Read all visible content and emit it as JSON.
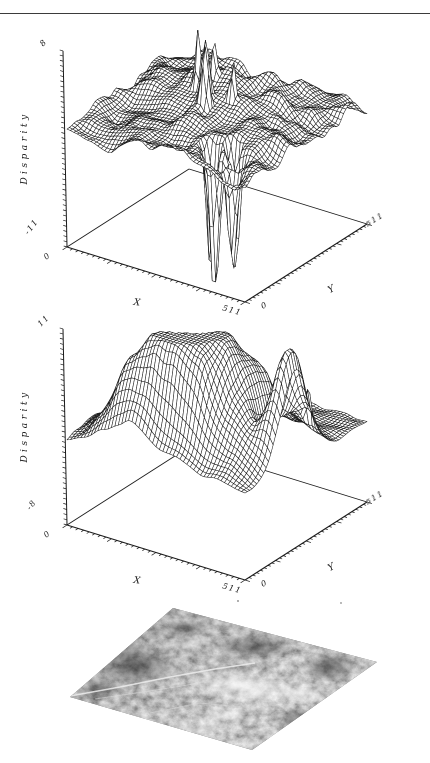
{
  "page": {
    "background": "#ffffff",
    "top_rule_color": "#3b3b3b",
    "line_color": "#1b1b1b"
  },
  "chart_data": [
    {
      "type": "3d-wireframe-surface",
      "title": "",
      "z_axis": {
        "label": "Disparity",
        "min": -11,
        "max": 8,
        "min_label": "-11",
        "max_label": "8",
        "tick_step": 0.5
      },
      "x_axis": {
        "label": "X",
        "min": 0,
        "max": 511,
        "min_label": "0",
        "max_label": "511",
        "tick_intervals": 32,
        "major_every": 8
      },
      "y_axis": {
        "label": "Y",
        "min": 0,
        "max": 511,
        "min_label": "0",
        "max_label": "511",
        "tick_intervals": 32,
        "major_every": 8
      },
      "grid": "wireframe-hidden-line",
      "projection": {
        "L": [
          67,
          217
        ],
        "F": [
          245,
          272
        ],
        "R": [
          367,
          194
        ],
        "z_px_per_unit": 10.32,
        "mesh_n": 52
      },
      "style": {
        "line_color": "#1b1b1b",
        "fill": "#ffffff"
      },
      "surface": {
        "seed": 11,
        "noise": {
          "base_amp": 1.35,
          "coupled_gain": 0,
          "cap": 1.35,
          "scale": 8
        },
        "features": [
          {
            "x": 256,
            "y": 256,
            "sx": 190,
            "sy": 190,
            "amp": 2.2
          },
          {
            "x": 140,
            "y": 340,
            "sx": 85,
            "sy": 75,
            "amp": 1.2
          },
          {
            "x": 330,
            "y": 330,
            "sx": 85,
            "sy": 85,
            "amp": 0.9
          },
          {
            "x": 80,
            "y": 80,
            "sx": 70,
            "sy": 70,
            "amp": -0.6
          },
          {
            "x": 236,
            "y": 236,
            "sx": 8,
            "sy": 8,
            "amp": 8
          },
          {
            "x": 255,
            "y": 206,
            "sx": 7,
            "sy": 7,
            "amp": 9.5
          },
          {
            "x": 188,
            "y": 276,
            "sx": 7,
            "sy": 7,
            "amp": 6
          },
          {
            "x": 302,
            "y": 252,
            "sx": 6,
            "sy": 6,
            "amp": 4.5
          },
          {
            "x": 216,
            "y": 300,
            "sx": 6,
            "sy": 6,
            "amp": 4
          },
          {
            "x": 388,
            "y": 52,
            "sx": 11,
            "sy": 11,
            "amp": -14
          },
          {
            "x": 424,
            "y": 84,
            "sx": 10,
            "sy": 10,
            "amp": -12
          },
          {
            "x": 356,
            "y": 84,
            "sx": 10,
            "sy": 10,
            "amp": -13
          },
          {
            "x": 450,
            "y": 36,
            "sx": 9,
            "sy": 9,
            "amp": -10
          },
          {
            "x": 398,
            "y": 116,
            "sx": 9,
            "sy": 9,
            "amp": -8.5
          }
        ]
      }
    },
    {
      "type": "3d-wireframe-surface",
      "title": "",
      "z_axis": {
        "label": "Disparity",
        "min": -8,
        "max": 11,
        "min_label": "-8",
        "max_label": "11",
        "tick_step": 0.5
      },
      "x_axis": {
        "label": "X",
        "min": 0,
        "max": 511,
        "min_label": "0",
        "max_label": "511",
        "tick_intervals": 32,
        "major_every": 8
      },
      "y_axis": {
        "label": "Y",
        "min": 0,
        "max": 511,
        "min_label": "0",
        "max_label": "511",
        "tick_intervals": 32,
        "major_every": 8
      },
      "grid": "wireframe-hidden-line",
      "projection": {
        "L": [
          67,
          217
        ],
        "F": [
          245,
          272
        ],
        "R": [
          367,
          194
        ],
        "z_px_per_unit": 10.32,
        "mesh_n": 52
      },
      "style": {
        "line_color": "#1b1b1b",
        "fill": "#ffffff"
      },
      "surface": {
        "seed": 23,
        "noise": {
          "base_amp": 0.38,
          "coupled_gain": 0.16,
          "cap": 1.5,
          "scale": 8
        },
        "features": [
          {
            "x": 256,
            "y": 110,
            "sx": 118,
            "sy": 68,
            "amp": 8.2
          },
          {
            "x": 165,
            "y": 62,
            "sx": 62,
            "sy": 45,
            "amp": 5
          },
          {
            "x": 305,
            "y": 195,
            "sx": 72,
            "sy": 85,
            "amp": 6
          },
          {
            "x": 495,
            "y": 210,
            "sx": 28,
            "sy": 55,
            "amp": 10.5
          },
          {
            "x": 400,
            "y": 235,
            "sx": 58,
            "sy": 72,
            "amp": 4.5
          },
          {
            "x": 440,
            "y": 205,
            "sx": 20,
            "sy": 40,
            "amp": -4
          },
          {
            "x": 120,
            "y": 300,
            "sx": 60,
            "sy": 90,
            "amp": 1.2
          },
          {
            "x": 300,
            "y": 28,
            "sx": 70,
            "sy": 24,
            "amp": -1.5
          },
          {
            "x": 480,
            "y": 310,
            "sx": 6,
            "sy": 6,
            "amp": 4
          }
        ]
      }
    }
  ],
  "ground_image": {
    "kind": "grayscale aerial terrain photograph shown as tilted plane",
    "corners": [
      [
        173,
        13
      ],
      [
        377,
        67
      ],
      [
        252,
        155
      ],
      [
        70,
        102
      ]
    ],
    "base_gray": "#787878",
    "bright_patch_color": "#eeeeee",
    "dark_patch_color": "#3f3f3f",
    "road_color": "#ececec"
  }
}
